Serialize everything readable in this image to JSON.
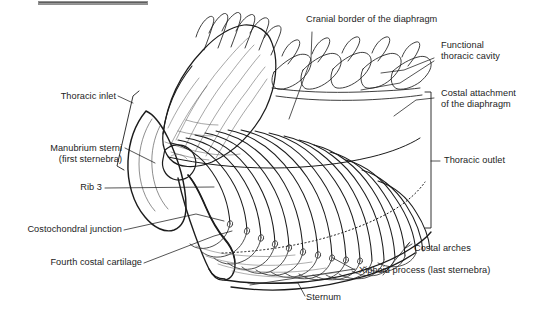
{
  "figure": {
    "background_color": "#ffffff",
    "line_color": "#1c1c1c",
    "text_color": "#1c1c1c",
    "width": 544,
    "height": 321
  },
  "topbar": {
    "name": "cropped-toolbar-strip",
    "color_dark": "#4a4a4a",
    "color_light": "#b9b9b9"
  },
  "labels": {
    "cranial_border": "Cranial border of the diaphragm",
    "functional_cavity_line1": "Functional",
    "functional_cavity_line2": "thoracic cavity",
    "costal_attachment_line1": "Costal attachment",
    "costal_attachment_line2": "of the diaphragm",
    "thoracic_outlet": "Thoracic outlet",
    "costal_arches": "Costal arches",
    "xiphoid_process": "Xiphoid process (last sternebra)",
    "sternum": "Sternum",
    "thoracic_inlet": "Thoracic inlet",
    "manubrium_line1": "Manubrium sterni",
    "manubrium_line2": "(first sternebra)",
    "rib_3": "Rib 3",
    "costochondral_junction": "Costochondral junction",
    "fourth_costal_cartilage": "Fourth costal cartilage"
  }
}
